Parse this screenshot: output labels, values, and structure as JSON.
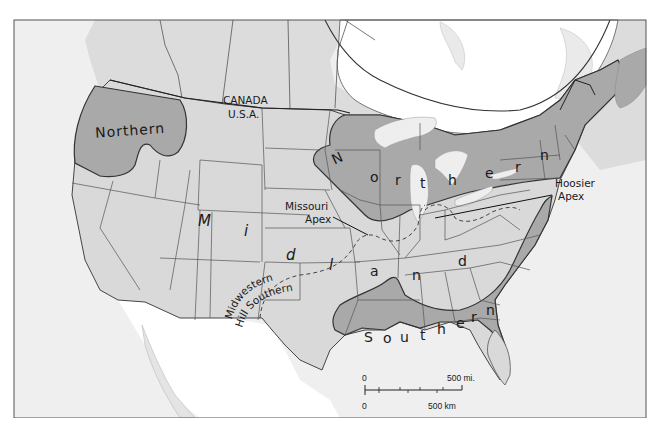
{
  "map": {
    "title": "",
    "frame": {
      "x": 14,
      "y": 20,
      "width": 632,
      "height": 398
    },
    "colors": {
      "ocean": "#efefef",
      "foreign_land": "#ffffff",
      "midland": "#d9d9d9",
      "northern": "#a9a9a9",
      "southern": "#a9a9a9",
      "border": "#555555",
      "isogloss": "#4a4a4a",
      "water": "#eeeeee"
    },
    "labels": {
      "canada": "CANADA",
      "usa": "U.S.A.",
      "northern_west": "Northern",
      "northern_east": [
        "N",
        "o",
        "r",
        "t",
        "h",
        "e",
        "r",
        "n"
      ],
      "midland": [
        "M",
        "i",
        "d",
        "l",
        "a",
        "n",
        "d"
      ],
      "southern": [
        "S",
        "o",
        "u",
        "t",
        "h",
        "e",
        "r",
        "n"
      ],
      "missouri_apex": [
        "Missouri",
        "Apex"
      ],
      "hoosier_apex": [
        "Hoosier",
        "Apex"
      ],
      "midwestern_hill_southern": [
        "Midwestern",
        "Hill Southern"
      ]
    },
    "dialect_regions": [
      {
        "name": "Northern",
        "shade": "dark"
      },
      {
        "name": "Midland",
        "shade": "light"
      },
      {
        "name": "Southern",
        "shade": "dark"
      },
      {
        "name": "Missouri Apex",
        "boundary": "dashed"
      },
      {
        "name": "Hoosier Apex",
        "boundary": "dashed"
      },
      {
        "name": "Midwestern Hill Southern",
        "boundary": "dashed"
      }
    ],
    "scale_bar": {
      "top_zero": "0",
      "top_label": "500 mi.",
      "bottom_zero": "0",
      "bottom_label": "500 km"
    }
  }
}
